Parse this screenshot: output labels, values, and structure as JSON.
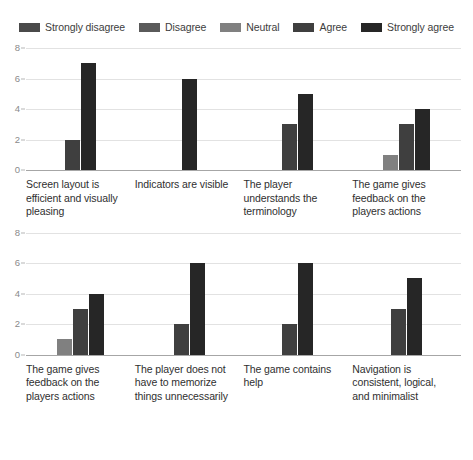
{
  "legend": {
    "position": "top-center",
    "items": [
      {
        "label": "Strongly disagree",
        "color": "#4a4a4a"
      },
      {
        "label": "Disagree",
        "color": "#5a5a5a"
      },
      {
        "label": "Neutral",
        "color": "#808080"
      },
      {
        "label": "Agree",
        "color": "#3f3f3f"
      },
      {
        "label": "Strongly agree",
        "color": "#262626"
      }
    ]
  },
  "chart_data": [
    {
      "type": "bar",
      "title": "",
      "xlabel": "",
      "ylabel": "",
      "ylim": [
        0,
        8
      ],
      "yticks": [
        0,
        2,
        4,
        6,
        8
      ],
      "grid": true,
      "legend_position": "top-center",
      "categories": [
        "Screen layout is efficient and visually pleasing",
        "Indicators are visible",
        "The player understands the terminology",
        "The game gives feedback on the players actions"
      ],
      "series": [
        {
          "name": "Strongly disagree",
          "values": [
            0,
            0,
            0,
            0
          ],
          "color": "#4a4a4a"
        },
        {
          "name": "Disagree",
          "values": [
            0,
            0,
            0,
            0
          ],
          "color": "#5a5a5a"
        },
        {
          "name": "Neutral",
          "values": [
            0,
            0,
            0,
            1
          ],
          "color": "#808080"
        },
        {
          "name": "Agree",
          "values": [
            2,
            0,
            3,
            3
          ],
          "color": "#3f3f3f"
        },
        {
          "name": "Strongly agree",
          "values": [
            7,
            6,
            5,
            4
          ],
          "color": "#262626"
        }
      ]
    },
    {
      "type": "bar",
      "title": "",
      "xlabel": "",
      "ylabel": "",
      "ylim": [
        0,
        8
      ],
      "yticks": [
        0,
        2,
        4,
        6,
        8
      ],
      "grid": true,
      "legend_position": "top-center",
      "categories": [
        "The game gives feedback on the players actions",
        "The player does not have to memorize things unnecessarily",
        "The game contains help",
        "Navigation is consistent, logical, and minimalist"
      ],
      "series": [
        {
          "name": "Strongly disagree",
          "values": [
            0,
            0,
            0,
            0
          ],
          "color": "#4a4a4a"
        },
        {
          "name": "Disagree",
          "values": [
            0,
            0,
            0,
            0
          ],
          "color": "#5a5a5a"
        },
        {
          "name": "Neutral",
          "values": [
            1,
            0,
            0,
            0
          ],
          "color": "#808080"
        },
        {
          "name": "Agree",
          "values": [
            3,
            2,
            2,
            3
          ],
          "color": "#3f3f3f"
        },
        {
          "name": "Strongly agree",
          "values": [
            4,
            6,
            6,
            5
          ],
          "color": "#262626"
        }
      ]
    }
  ]
}
